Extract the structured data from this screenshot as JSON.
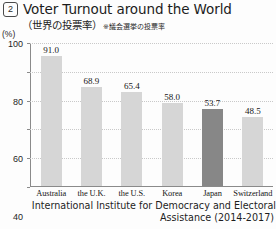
{
  "figure_number": "2",
  "title": "Voter Turnout around the World",
  "subtitle_ja": "（世界の投票率）",
  "subtitle_note": "※議会選挙の投票率",
  "unit_label": "(%)",
  "source_line1": "International Institute for Democracy and Electoral",
  "source_line2": "Assistance (2014-2017)",
  "colors": {
    "bar_default": "#d6d6d6",
    "bar_highlight": "#878787",
    "axis": "#8a8a8a",
    "gridline": "#c9c9c9",
    "text": "#1c1c1c"
  },
  "chart_data": {
    "type": "bar",
    "title": "Voter Turnout around the World",
    "xlabel": "",
    "ylabel": "(%)",
    "ylim": [
      0,
      100
    ],
    "yticks": [
      0,
      20,
      40,
      60,
      80,
      100
    ],
    "ytick_labels": [
      "0",
      "20",
      "40",
      "60",
      "80",
      "100"
    ],
    "grid": true,
    "legend": false,
    "annotation": "※議会選挙の投票率",
    "source": "International Institute for Democracy and Electoral Assistance (2014-2017)",
    "categories": [
      "Australia",
      "the U.K.",
      "the U.S.",
      "Korea",
      "Japan",
      "Switzerland"
    ],
    "values": [
      91.0,
      68.9,
      65.4,
      58.0,
      53.7,
      48.5
    ],
    "value_labels": [
      "91.0",
      "68.9",
      "65.4",
      "58.0",
      "53.7",
      "48.5"
    ],
    "highlight_index": 4,
    "highlight_category": "Japan"
  }
}
